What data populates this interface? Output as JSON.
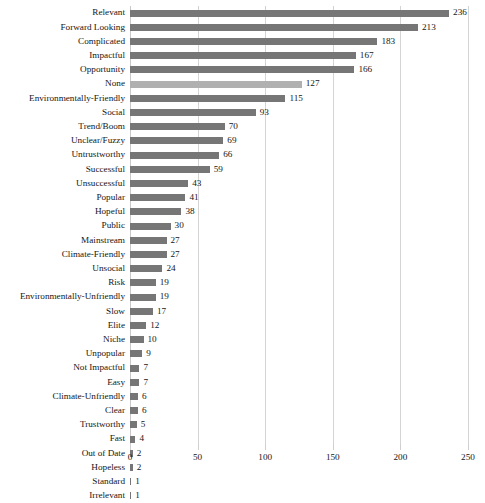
{
  "chart_data": {
    "type": "bar",
    "orientation": "horizontal",
    "title": "",
    "subtitle": "",
    "xlabel": "",
    "ylabel": "",
    "xlim": [
      0,
      250
    ],
    "xticks": [
      0,
      50,
      100,
      150,
      200,
      250
    ],
    "xtick_labels": [
      "0",
      "50",
      "100",
      "150",
      "200",
      "250"
    ],
    "grid": true,
    "grid_axis": "x",
    "legend": null,
    "bar_color": "#767676",
    "highlight_color": "#b0b0b0",
    "highlight_category": "None",
    "show_value_labels": true,
    "categories": [
      "Relevant",
      "Forward Looking",
      "Complicated",
      "Impactful",
      "Opportunity",
      "None",
      "Environmentally-Friendly",
      "Social",
      "Trend/Boom",
      "Unclear/Fuzzy",
      "Untrustworthy",
      "Successful",
      "Unsuccessful",
      "Popular",
      "Hopeful",
      "Public",
      "Mainstream",
      "Climate-Friendly",
      "Unsocial",
      "Risk",
      "Environmentally-Unfriendly",
      "Slow",
      "Elite",
      "Niche",
      "Unpopular",
      "Not Impactful",
      "Easy",
      "Climate-Unfriendly",
      "Clear",
      "Trustworthy",
      "Fast",
      "Out of Date",
      "Hopeless",
      "Standard",
      "Irrelevant"
    ],
    "values": [
      236,
      213,
      183,
      167,
      166,
      127,
      115,
      93,
      70,
      69,
      66,
      59,
      43,
      41,
      38,
      30,
      27,
      27,
      24,
      19,
      19,
      17,
      12,
      10,
      9,
      7,
      7,
      6,
      6,
      5,
      4,
      2,
      2,
      1,
      1
    ],
    "value_labels": [
      "236",
      "213",
      "183",
      "167",
      "166",
      "127",
      "115",
      "93",
      "70",
      "69",
      "66",
      "59",
      "43",
      "41",
      "38",
      "30",
      "27",
      "27",
      "24",
      "19",
      "19",
      "17",
      "12",
      "10",
      "9",
      "7",
      "7",
      "6",
      "6",
      "5",
      "4",
      "2",
      "2",
      "1",
      "1"
    ]
  }
}
